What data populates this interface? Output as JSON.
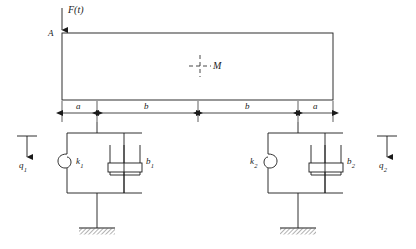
{
  "figure": {
    "type": "mechanical-schematic",
    "background_color": "#ffffff",
    "line_color": "#1a1a1a"
  },
  "beam": {
    "point_a_label": "A",
    "mass_label": "M",
    "x_left": 62,
    "x_right": 333,
    "y_top": 33,
    "y_bottom": 100
  },
  "force": {
    "label": "F(t)",
    "direction": "down",
    "applied_at": "A",
    "x": 62
  },
  "dimensions": {
    "segments": [
      {
        "label": "a",
        "x_start": 62,
        "x_end": 97
      },
      {
        "label": "b",
        "x_start": 97,
        "x_end": 198
      },
      {
        "label": "b",
        "x_start": 198,
        "x_end": 298
      },
      {
        "label": "a",
        "x_start": 298,
        "x_end": 333
      }
    ],
    "y": 113
  },
  "supports": [
    {
      "name": "left-support",
      "spring_label": "k",
      "spring_sub": "1",
      "spring_label_side": "right",
      "damper_label": "b",
      "damper_sub": "1",
      "damper_label_side": "right",
      "attach_x": 97,
      "box_left": 67,
      "box_right": 142,
      "box_top": 133,
      "box_bottom": 193,
      "ground_y": 228
    },
    {
      "name": "right-support",
      "spring_label": "k",
      "spring_sub": "2",
      "spring_label_side": "left",
      "damper_label": "b",
      "damper_sub": "2",
      "damper_label_side": "right",
      "attach_x": 298,
      "box_left": 268,
      "box_right": 343,
      "box_top": 133,
      "box_bottom": 193,
      "ground_y": 228
    }
  ],
  "coordinates": [
    {
      "name": "q1",
      "label": "q",
      "sub": "1",
      "x": 27,
      "datum_y": 136,
      "arrow_tip_y": 160,
      "direction": "down"
    },
    {
      "name": "q2",
      "label": "q",
      "sub": "2",
      "x": 387,
      "datum_y": 136,
      "arrow_tip_y": 160,
      "direction": "down"
    }
  ]
}
